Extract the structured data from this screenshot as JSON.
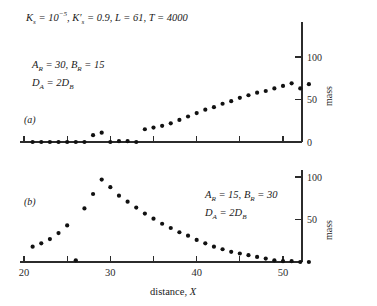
{
  "figure": {
    "header_params": "Kₛ = 10⁻⁵, K'ₛ = 0.9, L = 61, T = 4000",
    "xaxis_title": "distance, X",
    "yaxis_title": "mass"
  },
  "panels": [
    {
      "tag": "(a)",
      "params_line1": "AR = 30, BR = 15",
      "params_line2": "DA = 2DB"
    },
    {
      "tag": "(b)",
      "params_line1": "AR = 15, BR = 30",
      "params_line2": "DA = 2DB"
    }
  ],
  "axis": {
    "x_ticks_major": [
      "20",
      "30",
      "40",
      "50"
    ],
    "x_ticks_minor": [
      "25",
      "35",
      "45"
    ],
    "y_ticks_a": [
      "0",
      "50",
      "100"
    ],
    "y_ticks_b": [
      "50",
      "100"
    ]
  },
  "chart_data": {
    "type": "scatter",
    "title": "",
    "xlabel": "distance, X",
    "ylabel": "mass",
    "xlim": [
      20,
      54
    ],
    "grid": false,
    "legend": "none",
    "annotations": {
      "shared": "K_s = 10^-5, K'_s = 0.9, L = 61, T = 4000"
    },
    "panels": [
      {
        "name": "(a)",
        "annotation": "A_R = 30, B_R = 15; D_A = 2D_B",
        "ylim": [
          0,
          110
        ],
        "yticks": [
          0,
          50,
          100
        ],
        "x": [
          21,
          22,
          23,
          24,
          25,
          26,
          27,
          28,
          29,
          30,
          31,
          32,
          33,
          34,
          35,
          36,
          37,
          38,
          39,
          40,
          41,
          42,
          43,
          44,
          45,
          46,
          47,
          48,
          49,
          50,
          51,
          52,
          53
        ],
        "y": [
          0,
          0,
          0,
          0,
          0,
          0,
          0,
          8,
          11,
          0,
          1,
          1,
          0,
          15,
          17,
          19,
          22,
          26,
          30,
          34,
          38,
          41,
          45,
          48,
          52,
          55,
          58,
          60,
          63,
          66,
          69,
          63,
          68
        ]
      },
      {
        "name": "(b)",
        "annotation": "A_R = 15, B_R = 30; D_A = 2D_B",
        "ylim": [
          0,
          110
        ],
        "yticks": [
          50,
          100
        ],
        "x": [
          21,
          22,
          23,
          24,
          25,
          26,
          27,
          28,
          29,
          30,
          31,
          32,
          33,
          34,
          35,
          36,
          37,
          38,
          39,
          40,
          41,
          42,
          43,
          44,
          45,
          46,
          47,
          48,
          49,
          50,
          51,
          52,
          53
        ],
        "y": [
          18,
          22,
          27,
          34,
          43,
          2,
          63,
          80,
          97,
          88,
          78,
          71,
          64,
          57,
          51,
          45,
          40,
          35,
          31,
          26,
          22,
          18,
          15,
          12,
          10,
          8,
          6,
          4,
          2,
          1,
          1,
          0,
          0
        ]
      }
    ]
  }
}
